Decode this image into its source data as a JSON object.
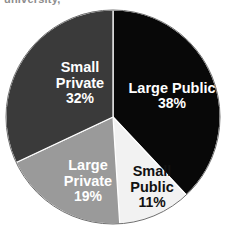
{
  "caption": {
    "clipped_text": "university,"
  },
  "chart_data": {
    "type": "pie",
    "title": "",
    "subtitle": "",
    "xlabel": "",
    "ylabel": "",
    "grid": false,
    "legend_position": "none",
    "labels_inside_slices": true,
    "start_angle_deg": 0,
    "direction": "clockwise",
    "center": {
      "cx": 113,
      "cy": 117,
      "r": 107
    },
    "categories": [
      "Large Public",
      "Small Public",
      "Large Private",
      "Small Private"
    ],
    "values": [
      38,
      11,
      19,
      32
    ],
    "value_unit": "%",
    "slices": [
      {
        "name": "Large Public",
        "value": 38,
        "value_label": "38%",
        "color": "#080808",
        "text_color": "#ffffff",
        "start_deg": 0,
        "end_deg": 136.8
      },
      {
        "name": "Small Public",
        "value": 11,
        "value_label": "11%",
        "color": "#f2f2f2",
        "text_color": "#111111",
        "start_deg": 136.8,
        "end_deg": 176.4
      },
      {
        "name": "Large Private",
        "value": 19,
        "value_label": "19%",
        "color": "#9a9a9a",
        "text_color": "#ffffff",
        "start_deg": 176.4,
        "end_deg": 244.8
      },
      {
        "name": "Small Private",
        "value": 32,
        "value_label": "32%",
        "color": "#3a3a3a",
        "text_color": "#ffffff",
        "start_deg": 244.8,
        "end_deg": 360
      }
    ],
    "slice_label_lines": {
      "large_public": [
        "Large Public"
      ],
      "small_public": [
        "Small",
        "Public"
      ],
      "large_private": [
        "Large",
        "Private"
      ],
      "small_private": [
        "Small",
        "Private"
      ]
    }
  }
}
